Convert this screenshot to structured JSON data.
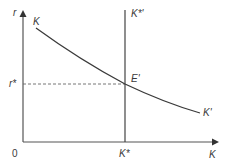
{
  "diagram": {
    "axes": {
      "y_label": "r",
      "x_label": "K",
      "origin_label": "0"
    },
    "curves": {
      "demand_curve_start_label": "K",
      "demand_curve_end_label": "K'",
      "supply_line_label": "K*'"
    },
    "equilibrium": {
      "point_label": "E'",
      "rate_label": "r*",
      "quantity_label": "K*"
    },
    "colors": {
      "line": "#3a3a3a",
      "axis": "#555555",
      "dashed": "#666666"
    }
  }
}
